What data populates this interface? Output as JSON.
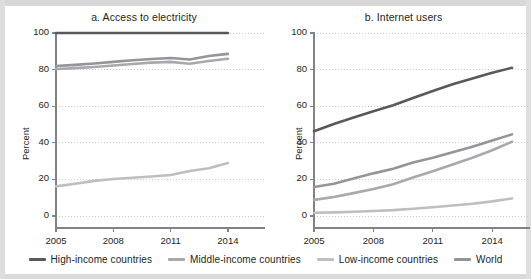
{
  "figure": {
    "background": "#ffffff",
    "page_background": "#cfcfcf"
  },
  "series_colors": {
    "high_income": "#58595b",
    "middle_income": "#a7a9ac",
    "low_income": "#bcbec0",
    "world": "#939598"
  },
  "axis": {
    "line_color": "#808285",
    "grid_color": "#c9cbcd",
    "text_color": "#231f20"
  },
  "legend": {
    "items": [
      {
        "label": "High-income countries",
        "color": "#58595b",
        "swatch": "line-swatch"
      },
      {
        "label": "Middle-income countries",
        "color": "#a7a9ac",
        "swatch": "line-swatch"
      },
      {
        "label": "Low-income countries",
        "color": "#bcbec0",
        "swatch": "line-swatch"
      },
      {
        "label": "World",
        "color": "#939598",
        "swatch": "line-swatch"
      }
    ]
  },
  "chart_data": [
    {
      "type": "line",
      "panel": "a",
      "title": "a. Access to electricity",
      "xlabel": "",
      "ylabel": "Percent",
      "ylim": [
        0,
        100
      ],
      "yticks": [
        0,
        20,
        40,
        60,
        80,
        100
      ],
      "xlim": [
        2005,
        2015
      ],
      "xticks": [
        2005,
        2008,
        2011,
        2014
      ],
      "xtick_labels": [
        "2005",
        "2008",
        "2011",
        "2014"
      ],
      "grid": "horizontal-dotted",
      "legend_position": "below-figure",
      "x": [
        2005,
        2006,
        2007,
        2008,
        2009,
        2010,
        2011,
        2012,
        2013,
        2014
      ],
      "series": [
        {
          "name": "High-income countries",
          "color": "#58595b",
          "values": [
            100,
            100,
            100,
            100,
            100,
            100,
            100,
            100,
            100,
            100
          ]
        },
        {
          "name": "World",
          "color": "#939598",
          "values": [
            82,
            82.6,
            83.3,
            84.2,
            85.1,
            85.8,
            86.3,
            85.5,
            87.4,
            88.6
          ]
        },
        {
          "name": "Middle-income countries",
          "color": "#a7a9ac",
          "values": [
            80.3,
            80.8,
            81.4,
            82.2,
            83.1,
            83.8,
            84.2,
            83.2,
            84.7,
            85.9
          ]
        },
        {
          "name": "Low-income countries",
          "color": "#bcbec0",
          "values": [
            16.2,
            17.6,
            19.2,
            20.2,
            20.9,
            21.6,
            22.4,
            24.6,
            26.1,
            28.9
          ]
        }
      ]
    },
    {
      "type": "line",
      "panel": "b",
      "title": "b. Internet users",
      "xlabel": "",
      "ylabel": "Percent",
      "ylim": [
        0,
        100
      ],
      "yticks": [
        0,
        20,
        40,
        60,
        80,
        100
      ],
      "xlim": [
        2005,
        2015
      ],
      "xticks": [
        2005,
        2008,
        2011,
        2014
      ],
      "xtick_labels": [
        "2005",
        "2008",
        "2011",
        "2014"
      ],
      "grid": "horizontal-dotted",
      "legend_position": "below-figure",
      "x": [
        2005,
        2006,
        2007,
        2008,
        2009,
        2010,
        2011,
        2012,
        2013,
        2014,
        2015
      ],
      "series": [
        {
          "name": "High-income countries",
          "color": "#58595b",
          "values": [
            46.3,
            50.3,
            53.8,
            57.3,
            60.5,
            64.5,
            68.3,
            72.0,
            75.2,
            78.3,
            81.0
          ]
        },
        {
          "name": "World",
          "color": "#939598",
          "values": [
            15.8,
            17.6,
            20.5,
            23.3,
            25.8,
            29.2,
            31.8,
            34.8,
            37.9,
            41.2,
            44.6
          ]
        },
        {
          "name": "Middle-income countries",
          "color": "#a7a9ac",
          "values": [
            8.8,
            10.4,
            12.5,
            14.8,
            17.4,
            21.0,
            24.5,
            28.1,
            31.8,
            35.9,
            40.6
          ]
        },
        {
          "name": "Low-income countries",
          "color": "#bcbec0",
          "values": [
            1.8,
            2.0,
            2.3,
            2.7,
            3.2,
            4.0,
            4.8,
            5.7,
            6.7,
            8.0,
            9.6
          ]
        }
      ]
    }
  ]
}
